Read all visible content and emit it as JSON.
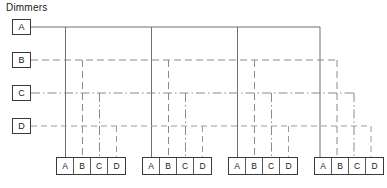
{
  "diagram": {
    "title": "Dimmers",
    "type": "lighting-dimmer-patch-schematic",
    "dimmers": [
      {
        "id": "A",
        "label": "A",
        "line_style": "solid",
        "color": "#6f6f6f",
        "row_y": 27
      },
      {
        "id": "B",
        "label": "B",
        "line_style": "dashed",
        "color": "#8a8a8a",
        "row_y": 60
      },
      {
        "id": "C",
        "label": "C",
        "line_style": "dash-dot",
        "color": "#8a8a8a",
        "row_y": 93
      },
      {
        "id": "D",
        "label": "D",
        "line_style": "dashed",
        "color": "#9a9a9a",
        "row_y": 126
      }
    ],
    "fixture_groups": [
      {
        "name": "group-1",
        "x": 56,
        "channels": [
          "A",
          "B",
          "C",
          "D"
        ]
      },
      {
        "name": "group-2",
        "x": 142,
        "channels": [
          "A",
          "B",
          "C",
          "D"
        ]
      },
      {
        "name": "group-3",
        "x": 228,
        "channels": [
          "A",
          "B",
          "C",
          "D"
        ]
      },
      {
        "name": "group-4",
        "x": 314,
        "channels": [
          "A",
          "B",
          "C",
          "D"
        ]
      }
    ],
    "channel_labels": [
      "A",
      "B",
      "C",
      "D"
    ]
  }
}
